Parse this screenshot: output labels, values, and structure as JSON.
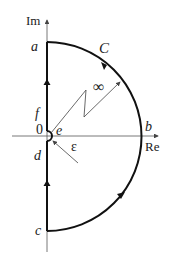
{
  "diagram": {
    "type": "contour-integration",
    "axes": {
      "imag_label": "Im",
      "real_label": "Re"
    },
    "points": {
      "a": "a",
      "b": "b",
      "c": "c",
      "d": "d",
      "e": "e",
      "f": "f",
      "origin": "0"
    },
    "contour_label": "C",
    "infinity_label": "∞",
    "epsilon_label": "ε",
    "colors": {
      "stroke": "#111111",
      "axis": "#555555",
      "thin": "#444444"
    }
  }
}
